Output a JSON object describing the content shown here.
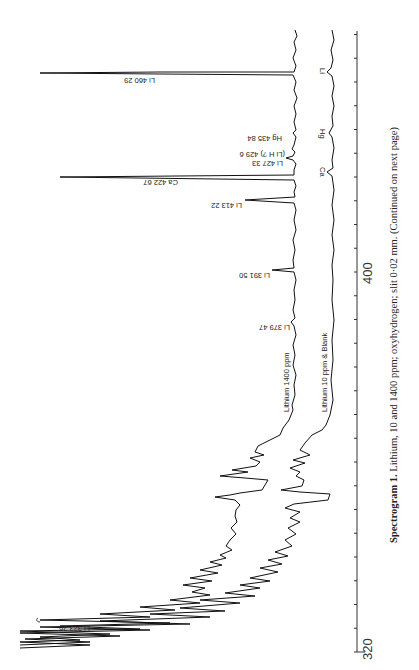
{
  "caption": {
    "title": "Spectrogram 1.",
    "text": "Lithium, 10 and 1400 ppm; oxyhydrogen; slit 0·02 mm. (Continued on next page)"
  },
  "axis": {
    "ticks": [
      {
        "label": "320",
        "y": 652
      },
      {
        "label": "400",
        "y": 272
      }
    ]
  },
  "traces": {
    "upper_label": "Lithium 1400 ppm",
    "lower_label": "Lithium 10 ppm  &  Blank"
  },
  "peak_labels": [
    {
      "text": "Li 460 29",
      "x": 120,
      "y": 74
    },
    {
      "text": "Hg 435 84",
      "x": 200,
      "y": 133
    },
    {
      "text": "(Li H ?) 429 6",
      "x": 185,
      "y": 149
    },
    {
      "text": "Li 427 33",
      "x": 190,
      "y": 158
    },
    {
      "text": "Ca 422 67",
      "x": 120,
      "y": 177
    },
    {
      "text": "Li 413 22",
      "x": 200,
      "y": 200
    },
    {
      "text": "Li 391 50",
      "x": 225,
      "y": 270
    },
    {
      "text": "Li 379 47",
      "x": 225,
      "y": 322
    },
    {
      "text": "Li 323 26",
      "x": 55,
      "y": 623
    }
  ],
  "lower_marks": [
    {
      "text": "Li",
      "y": 72
    },
    {
      "text": "Hg",
      "y": 133
    },
    {
      "text": "Ca",
      "y": 172
    }
  ],
  "chart_data": {
    "type": "line",
    "title": "Spectrogram 1. Lithium, 10 and 1400 ppm; oxyhydrogen; slit 0·02 mm.",
    "xlabel": "Wavelength (nm)",
    "ylabel": "Intensity",
    "orientation": "rotated 90° (wavelength axis vertical, 320 at bottom)",
    "x_ticks": [
      "320",
      "400"
    ],
    "xlim": [
      320,
      462
    ],
    "series": [
      {
        "name": "Lithium 1400 ppm",
        "peaks": [
          {
            "line": "Li",
            "wavelength": 460.29,
            "relative_height": 0.95
          },
          {
            "line": "Hg",
            "wavelength": 435.84,
            "relative_height": 0.02
          },
          {
            "line": "LiH?",
            "wavelength": 429.6,
            "relative_height": 0.03
          },
          {
            "line": "Li",
            "wavelength": 427.33,
            "relative_height": 0.05
          },
          {
            "line": "Ca",
            "wavelength": 422.67,
            "relative_height": 0.82
          },
          {
            "line": "Li",
            "wavelength": 413.22,
            "relative_height": 0.2
          },
          {
            "line": "Li",
            "wavelength": 391.5,
            "relative_height": 0.07
          },
          {
            "line": "Li",
            "wavelength": 379.47,
            "relative_height": 0.02
          },
          {
            "line": "Li",
            "wavelength": 323.26,
            "relative_height": 1.0
          }
        ]
      },
      {
        "name": "Lithium 10 ppm & Blank",
        "peaks": [
          {
            "line": "Li",
            "wavelength": 460.29,
            "relative_height": 0.03
          },
          {
            "line": "Hg",
            "wavelength": 435.84,
            "relative_height": 0.02
          },
          {
            "line": "Ca",
            "wavelength": 422.67,
            "relative_height": 0.02
          }
        ]
      }
    ],
    "annotations": [
      "OH band structure between ~306–350 nm (noisy region)"
    ],
    "grid": false,
    "legend": "inline text labels"
  }
}
